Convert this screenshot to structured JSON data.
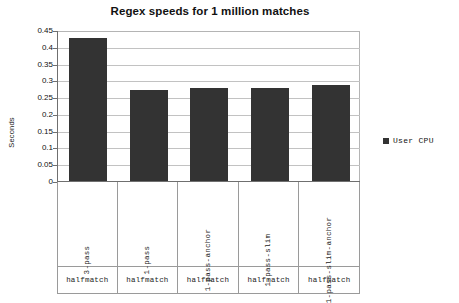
{
  "chart_data": {
    "type": "bar",
    "title": "Regex speeds for 1 million matches",
    "xlabel": "",
    "ylabel": "Seconds",
    "ylim": [
      0,
      0.45
    ],
    "ytick_labels": [
      "0.45",
      "0.4",
      "0.35",
      "0.3",
      "0.25",
      "0.2",
      "0.15",
      "0.1",
      "0.05",
      "0"
    ],
    "ytick_values": [
      0.45,
      0.4,
      0.35,
      0.3,
      0.25,
      0.2,
      0.15,
      0.1,
      0.05,
      0
    ],
    "grid": true,
    "legend_position": "right",
    "categories": [
      "3-pass",
      "1-pass",
      "1-pass-anchor",
      "1-pass-slim",
      "1-pass-slim-anchor"
    ],
    "group_labels": [
      "halfmatch",
      "halfmatch",
      "halfmatch",
      "halfmatch",
      "halfmatch"
    ],
    "series": [
      {
        "name": "User CPU",
        "color": "#333333",
        "values": [
          0.425,
          0.272,
          0.277,
          0.277,
          0.285
        ]
      }
    ]
  },
  "legend": {
    "entries": [
      {
        "label": "User CPU",
        "swatch_color": "#333333"
      }
    ]
  },
  "colors": {
    "bar": "#333333",
    "gridline": "#c2c2c2",
    "axis": "#6f6f6f",
    "frame": "#b4b4b4",
    "cell_border": "#9a9a9a",
    "text": "#111111",
    "background": "#ffffff"
  }
}
